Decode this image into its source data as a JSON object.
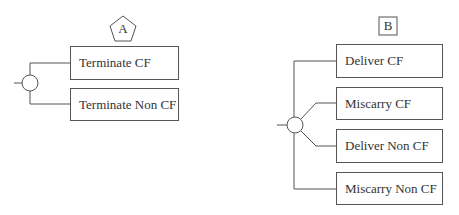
{
  "diagram_a": {
    "marker": "A",
    "marker_shape": "pentagon",
    "node": "chance-node",
    "branches": [
      "Terminate CF",
      "Terminate Non CF"
    ]
  },
  "diagram_b": {
    "marker": "B",
    "marker_shape": "square",
    "node": "chance-node",
    "branches": [
      "Deliver CF",
      "Miscarry CF",
      "Deliver Non CF",
      "Miscarry Non CF"
    ]
  },
  "colors": {
    "line": "#555555",
    "text": "#333333",
    "background": "#ffffff"
  }
}
